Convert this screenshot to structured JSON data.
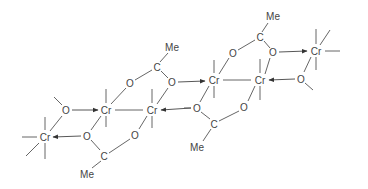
{
  "diagram": {
    "title": "",
    "type": "chemical-structure",
    "labels": {
      "cr": "Cr",
      "o": "O",
      "c": "C",
      "me": "Me"
    },
    "atoms": [
      {
        "id": "cr1",
        "label": "Cr",
        "x": 45,
        "y": 137
      },
      {
        "id": "cr2",
        "label": "Cr",
        "x": 106,
        "y": 110
      },
      {
        "id": "cr3",
        "label": "Cr",
        "x": 152,
        "y": 110
      },
      {
        "id": "cr4",
        "label": "Cr",
        "x": 214,
        "y": 80
      },
      {
        "id": "cr5",
        "label": "Cr",
        "x": 260,
        "y": 80
      },
      {
        "id": "cr6",
        "label": "Cr",
        "x": 316,
        "y": 51
      },
      {
        "id": "o_a",
        "label": "O",
        "x": 66,
        "y": 110
      },
      {
        "id": "o_b",
        "label": "O",
        "x": 87,
        "y": 136
      },
      {
        "id": "o_c",
        "label": "O",
        "x": 135,
        "y": 135
      },
      {
        "id": "c_low1",
        "label": "C",
        "x": 104,
        "y": 156
      },
      {
        "id": "me_low1",
        "label": "Me",
        "x": 87,
        "y": 174
      },
      {
        "id": "o_d",
        "label": "O",
        "x": 130,
        "y": 83
      },
      {
        "id": "o_e",
        "label": "O",
        "x": 172,
        "y": 82
      },
      {
        "id": "c_up1",
        "label": "C",
        "x": 157,
        "y": 67
      },
      {
        "id": "me_up1",
        "label": "Me",
        "x": 172,
        "y": 48
      },
      {
        "id": "o_f",
        "label": "O",
        "x": 197,
        "y": 108
      },
      {
        "id": "o_g",
        "label": "O",
        "x": 244,
        "y": 107
      },
      {
        "id": "c_low2",
        "label": "C",
        "x": 214,
        "y": 124
      },
      {
        "id": "me_low2",
        "label": "Me",
        "x": 197,
        "y": 147
      },
      {
        "id": "o_h",
        "label": "O",
        "x": 233,
        "y": 53
      },
      {
        "id": "o_i",
        "label": "O",
        "x": 273,
        "y": 52
      },
      {
        "id": "c_up2",
        "label": "C",
        "x": 260,
        "y": 37
      },
      {
        "id": "me_up2",
        "label": "Me",
        "x": 273,
        "y": 16
      },
      {
        "id": "o_j",
        "label": "O",
        "x": 301,
        "y": 79
      }
    ]
  }
}
